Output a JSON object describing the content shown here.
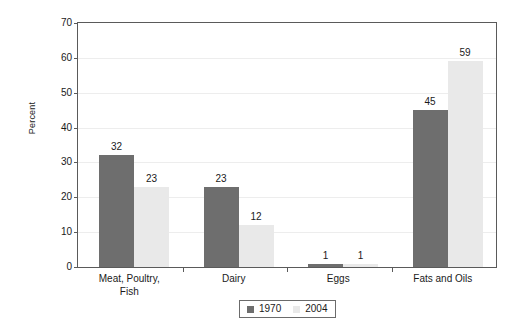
{
  "chart_data": {
    "type": "bar",
    "title": "",
    "xlabel": "",
    "ylabel": "Percent",
    "ylim": [
      0,
      70
    ],
    "yticks": [
      0,
      10,
      20,
      30,
      40,
      50,
      60,
      70
    ],
    "ytick_labels": [
      "0",
      "10",
      "20",
      "30",
      "40",
      "50",
      "60",
      "70"
    ],
    "grid": true,
    "legend_position": "bottom-center",
    "categories": [
      "Meat, Poultry, Fish",
      "Dairy",
      "Eggs",
      "Fats and Oils"
    ],
    "category_label_lines": [
      [
        "Meat, Poultry,",
        "Fish"
      ],
      [
        "Dairy"
      ],
      [
        "Eggs"
      ],
      [
        "Fats and Oils"
      ]
    ],
    "series": [
      {
        "name": "1970",
        "color": "#6e6e6e",
        "values": [
          32,
          23,
          1,
          45
        ],
        "value_labels": [
          "32",
          "23",
          "1",
          "45"
        ]
      },
      {
        "name": "2004",
        "color": "#e9e9e9",
        "values": [
          23,
          12,
          1,
          59
        ],
        "value_labels": [
          "23",
          "12",
          "1",
          "59"
        ]
      }
    ]
  },
  "chart_values_by_series": {
    "1970": [
      32,
      12,
      1,
      45
    ],
    "2004": [
      23,
      12,
      1,
      59
    ]
  },
  "legend": {
    "items": [
      {
        "label": "1970",
        "color": "#6e6e6e"
      },
      {
        "label": "2004",
        "color": "#e9e9e9"
      }
    ]
  },
  "colors": {
    "series_1970": "#6e6e6e",
    "series_2004": "#e9e9e9",
    "axis": "#5a5a5a",
    "grid": "#ededed",
    "text": "#1a1a1a",
    "background": "#ffffff"
  }
}
